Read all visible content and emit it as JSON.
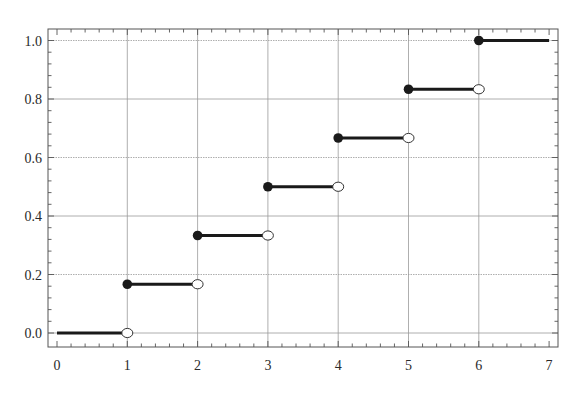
{
  "chart_data": {
    "type": "line",
    "subtype": "step-function (CDF of discrete uniform on {1..6})",
    "title": "",
    "xlabel": "",
    "ylabel": "",
    "xlim": [
      0,
      7
    ],
    "ylim": [
      0.0,
      1.0
    ],
    "grid": true,
    "legend": null,
    "x_ticks": [
      0,
      1,
      2,
      3,
      4,
      5,
      6,
      7
    ],
    "x_tick_labels": [
      "0",
      "1",
      "2",
      "3",
      "4",
      "5",
      "6",
      "7"
    ],
    "y_ticks": [
      0.0,
      0.2,
      0.4,
      0.6,
      0.8,
      1.0
    ],
    "y_tick_labels": [
      "0.0",
      "0.2",
      "0.4",
      "0.6",
      "0.8",
      "1.0"
    ],
    "x_minor_per_major": 5,
    "y_minor_per_major": 5,
    "series": [
      {
        "name": "F(x)",
        "segments": [
          {
            "x_start": 0,
            "x_end": 1,
            "y": 0.0,
            "closed_start": false,
            "open_end": true
          },
          {
            "x_start": 1,
            "x_end": 2,
            "y": 0.1667,
            "closed_start": true,
            "open_end": true
          },
          {
            "x_start": 2,
            "x_end": 3,
            "y": 0.3333,
            "closed_start": true,
            "open_end": true
          },
          {
            "x_start": 3,
            "x_end": 4,
            "y": 0.5,
            "closed_start": true,
            "open_end": true
          },
          {
            "x_start": 4,
            "x_end": 5,
            "y": 0.6667,
            "closed_start": true,
            "open_end": true
          },
          {
            "x_start": 5,
            "x_end": 6,
            "y": 0.8333,
            "closed_start": true,
            "open_end": true
          },
          {
            "x_start": 6,
            "x_end": 7,
            "y": 1.0,
            "closed_start": true,
            "open_end": false
          }
        ]
      }
    ]
  },
  "colors": {
    "line": "#1a1a1a",
    "grid": "#9a9a9a",
    "frame": "#555555",
    "text": "#2a2a2a"
  }
}
